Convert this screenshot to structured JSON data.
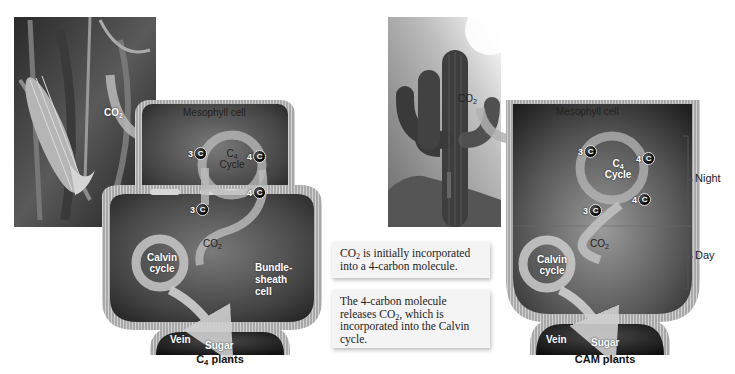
{
  "c4_panel": {
    "caption_prefix": "C",
    "caption_sub": "4",
    "caption_suffix": " plants",
    "photo": "corn-plant-photo",
    "co2_label": "CO",
    "co2_sub": "2",
    "mesophyll_label": "Mesophyll cell",
    "c4_cycle_prefix": "C",
    "c4_cycle_sub": "4",
    "c4_cycle_label": "Cycle",
    "badges": [
      {
        "num": "3",
        "letter": "C"
      },
      {
        "num": "4",
        "letter": "C"
      },
      {
        "num": "4",
        "letter": "C"
      },
      {
        "num": "3",
        "letter": "C"
      }
    ],
    "inner_co2_label": "CO",
    "inner_co2_sub": "2",
    "calvin_line1": "Calvin",
    "calvin_line2": "cycle",
    "bundle_line1": "Bundle-",
    "bundle_line2": "sheath",
    "bundle_line3": "cell",
    "vein_label": "Vein",
    "sugar_label": "Sugar"
  },
  "cam_panel": {
    "caption": "CAM plants",
    "photo": "saguaro-cactus-photo",
    "co2_label": "CO",
    "co2_sub": "2",
    "mesophyll_label": "Mesophyll cell",
    "c4_cycle_prefix": "C",
    "c4_cycle_sub": "4",
    "c4_cycle_label": "Cycle",
    "badges": [
      {
        "num": "3",
        "letter": "C"
      },
      {
        "num": "4",
        "letter": "C"
      },
      {
        "num": "4",
        "letter": "C"
      },
      {
        "num": "3",
        "letter": "C"
      }
    ],
    "inner_co2_label": "CO",
    "inner_co2_sub": "2",
    "calvin_line1": "Calvin",
    "calvin_line2": "cycle",
    "vein_label": "Vein",
    "sugar_label": "Sugar",
    "night_label": "Night",
    "day_label": "Day"
  },
  "callouts": [
    {
      "parts": [
        "CO",
        "2",
        " is initially incorporated into a 4-carbon molecule."
      ]
    },
    {
      "parts": [
        "The 4-carbon molecule releases CO",
        "2",
        ", which is incorporated into the Calvin cycle."
      ]
    }
  ],
  "colors": {
    "cell_dark": "#3a3a3a",
    "cell_mid": "#6a6a6a",
    "membrane": "#9a9a9a",
    "arrow": "#c8c8c8",
    "background": "#ffffff"
  }
}
